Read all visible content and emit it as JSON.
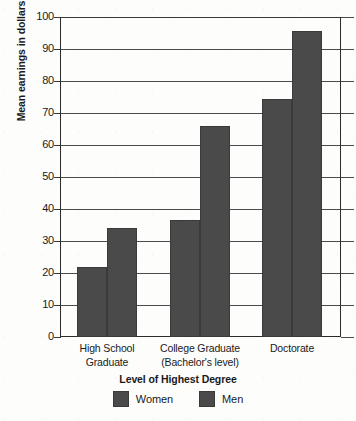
{
  "chart_data": {
    "type": "bar",
    "title": "",
    "xlabel": "Level of Highest Degree",
    "ylabel": "Mean earnings in dollars",
    "categories": [
      "High School Graduate",
      "College Graduate (Bachelor's level)",
      "Doctorate"
    ],
    "category_lines": [
      [
        "High School",
        "Graduate"
      ],
      [
        "College Graduate",
        "(Bachelor's level)"
      ],
      [
        "Doctorate",
        ""
      ]
    ],
    "series": [
      {
        "name": "Women",
        "values": [
          22,
          36.5,
          74.5
        ],
        "color": "#4a4a4a"
      },
      {
        "name": "Men",
        "values": [
          34,
          66,
          95.5
        ],
        "color": "#4a4a4a"
      }
    ],
    "ylim": [
      0,
      100
    ],
    "ytick_step": 10,
    "yticks": [
      "0",
      "10",
      "20",
      "30",
      "40",
      "50",
      "60",
      "70",
      "80",
      "90",
      "100"
    ],
    "grid": true,
    "legend_position": "bottom",
    "legend_entries": [
      "Women",
      "Men"
    ]
  },
  "axis": {
    "y_title": "Mean earnings in dollars",
    "x_title": "Level of Highest Degree"
  },
  "colors": {
    "bar_fill": "#4a4a4a",
    "bar_stroke": "#3a3a3a",
    "grid": "#4a4a4a",
    "axis": "#2b2b2b",
    "background": "#fdfdfc",
    "text": "#1a1a1a"
  }
}
